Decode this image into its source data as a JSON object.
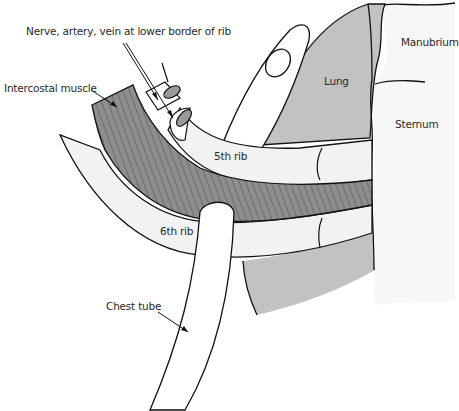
{
  "figure": {
    "colors": {
      "lung": "#c2c2c2",
      "muscle": "#8e8e8e",
      "muscle_stripes": "#5a5a5a",
      "rib": "#f2f2f2",
      "outline": "#111111",
      "background": "#ffffff"
    },
    "labels": {
      "nerve": "Nerve, artery, vein at lower border of rib",
      "intercostal": "Intercostal muscle",
      "lung": "Lung",
      "manubrium": "Manubrium",
      "sternum": "Sternum",
      "rib5": "5th rib",
      "rib6": "6th rib",
      "chest_tube": "Chest tube"
    }
  }
}
